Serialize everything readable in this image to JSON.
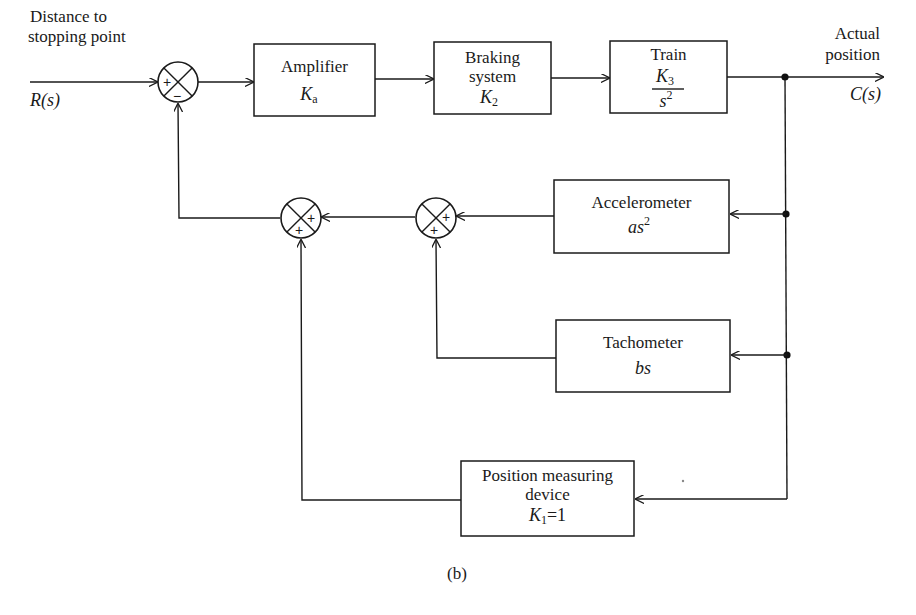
{
  "diagram": {
    "type": "block-diagram",
    "caption": "(b)",
    "input": {
      "label_line1": "Distance to",
      "label_line2": "stopping point",
      "symbol": "R(s)"
    },
    "output": {
      "label_line1": "Actual",
      "label_line2": "position",
      "symbol": "C(s)"
    },
    "blocks": {
      "amplifier": {
        "name": "Amplifier",
        "gain_main": "K",
        "gain_sub": "a"
      },
      "braking": {
        "name_line1": "Braking",
        "name_line2": "system",
        "gain_main": "K",
        "gain_sub": "2"
      },
      "train": {
        "name": "Train",
        "numerator_main": "K",
        "numerator_sub": "3",
        "denominator_main": "s",
        "denominator_sup": "2"
      },
      "accelerometer": {
        "name": "Accelerometer",
        "tf_main": "as",
        "tf_sup": "2"
      },
      "tachometer": {
        "name": "Tachometer",
        "tf": "bs"
      },
      "position_device": {
        "name_line1": "Position measuring",
        "name_line2": "device",
        "gain_main": "K",
        "gain_sub": "1",
        "gain_value": "=1"
      }
    },
    "summing_junctions": [
      {
        "id": "sum-main",
        "signs": [
          "+",
          "−"
        ]
      },
      {
        "id": "sum-feedback-outer",
        "signs": [
          "+",
          "+"
        ]
      },
      {
        "id": "sum-feedback-inner",
        "signs": [
          "+",
          "+"
        ]
      }
    ]
  }
}
